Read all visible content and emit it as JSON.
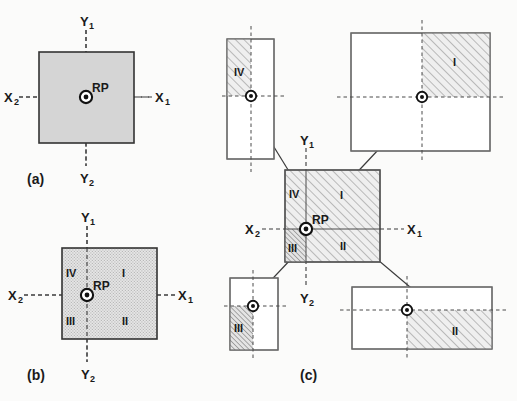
{
  "figure": {
    "caption_a": "(a)",
    "caption_b": "(b)",
    "caption_c": "(c)",
    "rp_label": "RP",
    "axis": {
      "x1": "X",
      "x1_sub": "1",
      "x2": "X",
      "x2_sub": "2",
      "y1": "Y",
      "y1_sub": "1",
      "y2": "Y",
      "y2_sub": "2"
    },
    "quadrants": {
      "q1": "I",
      "q2": "II",
      "q3": "III",
      "q4": "IV"
    }
  },
  "colors": {
    "background": "#fbfbfa",
    "ink": "#1a1a1a",
    "stroke": "#4a4a4a",
    "fill_solid_gray": "#d5d5d5",
    "fill_stipple": "#e2e2e2",
    "hatch_line": "#8c8c8c",
    "hatch_line_dense": "#6f6f6f",
    "dashed_axis": "#3a3a3a"
  },
  "panel_a": {
    "name": "(a)",
    "square": {
      "x": 39,
      "y": 52,
      "w": 95,
      "h": 91
    },
    "fill": "solid-gray",
    "rp": {
      "x": 86,
      "y": 97
    },
    "labels": {
      "x1": "X",
      "x2": "X",
      "y1": "Y",
      "y2": "Y",
      "rp": "RP"
    },
    "quadrant_labels_visible": false
  },
  "panel_b": {
    "name": "(b)",
    "square": {
      "x": 62,
      "y": 248,
      "w": 95,
      "h": 91
    },
    "fill": "stipple",
    "rp": {
      "x": 87,
      "y": 295
    },
    "labels": {
      "x1": "X",
      "x2": "X",
      "y1": "Y",
      "y2": "Y",
      "rp": "RP"
    },
    "quadrant_labels_visible": true,
    "quadrants": [
      {
        "id": "I",
        "label": "I",
        "x": 127,
        "y": 272
      },
      {
        "id": "II",
        "label": "II",
        "x": 127,
        "y": 320
      },
      {
        "id": "III",
        "label": "III",
        "x": 72,
        "y": 320
      },
      {
        "id": "IV",
        "label": "IV",
        "x": 72,
        "y": 272
      }
    ]
  },
  "panel_c": {
    "name": "(c)",
    "center_square": {
      "x": 285,
      "y": 170,
      "w": 95,
      "h": 92
    },
    "rp": {
      "x": 306,
      "y": 229
    },
    "labels": {
      "x1": "X",
      "x2": "X",
      "y1": "Y",
      "y2": "Y",
      "rp": "RP"
    },
    "quadrants": [
      {
        "id": "I",
        "label": "I",
        "hatch": "normal",
        "x": 345,
        "y": 195
      },
      {
        "id": "II",
        "label": "II",
        "hatch": "normal",
        "x": 345,
        "y": 245
      },
      {
        "id": "III",
        "label": "III",
        "hatch": "dense",
        "x": 294,
        "y": 247
      },
      {
        "id": "IV",
        "label": "IV",
        "hatch": "normal",
        "x": 295,
        "y": 193
      }
    ],
    "satellites": [
      {
        "id": "IV",
        "label": "IV",
        "rect": {
          "x": 227,
          "y": 39,
          "w": 47,
          "h": 120
        },
        "rp": {
          "x": 251,
          "y": 96
        },
        "hatched_quadrant": "upper-left",
        "label_pos": {
          "x": 239,
          "y": 72
        },
        "arrow": {
          "x1": 290,
          "y1": 173,
          "x2": 238,
          "y2": 90
        }
      },
      {
        "id": "I",
        "label": "I",
        "rect": {
          "x": 351,
          "y": 33,
          "w": 139,
          "h": 118
        },
        "rp": {
          "x": 422,
          "y": 97
        },
        "hatched_quadrant": "upper-right",
        "label_pos": {
          "x": 455,
          "y": 62
        },
        "arrow": {
          "x1": 348,
          "y1": 182,
          "x2": 443,
          "y2": 81
        }
      },
      {
        "id": "III",
        "label": "III",
        "rect": {
          "x": 230,
          "y": 278,
          "w": 48,
          "h": 72
        },
        "rp": {
          "x": 253,
          "y": 306
        },
        "hatched_quadrant": "lower-left",
        "label_pos": {
          "x": 240,
          "y": 327
        },
        "arrow": {
          "x1": 292,
          "y1": 258,
          "x2": 240,
          "y2": 313
        }
      },
      {
        "id": "II",
        "label": "II",
        "rect": {
          "x": 352,
          "y": 287,
          "w": 140,
          "h": 62
        },
        "rp": {
          "x": 407,
          "y": 310
        },
        "hatched_quadrant": "lower-right",
        "label_pos": {
          "x": 455,
          "y": 330
        },
        "arrow": {
          "x1": 352,
          "y1": 238,
          "x2": 438,
          "y2": 311
        }
      }
    ]
  }
}
